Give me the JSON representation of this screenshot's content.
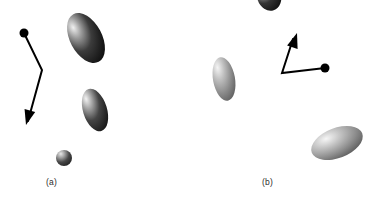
{
  "figure": {
    "width": 383,
    "height": 202,
    "background": "#ffffff",
    "type": "scientific-diagram"
  },
  "panels": [
    {
      "id": "a",
      "label": "(a)",
      "label_x": 46,
      "label_y": 177
    },
    {
      "id": "b",
      "label": "(b)",
      "label_x": 262,
      "label_y": 177
    }
  ],
  "ellipsoids": [
    {
      "name": "ellipsoid-a-large-top",
      "panel": "a",
      "cx": 86,
      "cy": 38,
      "rx": 16,
      "ry": 27,
      "rotation": -28,
      "light": "#e8e8e8",
      "dark": "#1a1a1a"
    },
    {
      "name": "ellipsoid-a-mid",
      "panel": "a",
      "cx": 95,
      "cy": 110,
      "rx": 12,
      "ry": 22,
      "rotation": -17,
      "light": "#ededed",
      "dark": "#222222"
    },
    {
      "name": "ellipsoid-a-small-bottom",
      "panel": "a",
      "cx": 64,
      "cy": 158,
      "rx": 8,
      "ry": 8,
      "rotation": 0,
      "light": "#e0e0e0",
      "dark": "#2a2a2a"
    },
    {
      "name": "ellipsoid-b-top-clipped",
      "panel": "b",
      "cx": 269,
      "cy": -4,
      "rx": 12,
      "ry": 15,
      "rotation": -18,
      "light": "#e6e6e6",
      "dark": "#1c1c1c"
    },
    {
      "name": "ellipsoid-b-left",
      "panel": "b",
      "cx": 224,
      "cy": 79,
      "rx": 11,
      "ry": 22,
      "rotation": -10,
      "light": "#f0f0f0",
      "dark": "#6a6a6a"
    },
    {
      "name": "ellipsoid-b-bottom-right",
      "panel": "b",
      "cx": 337,
      "cy": 143,
      "rx": 27,
      "ry": 15,
      "rotation": -21,
      "light": "#f2f2f2",
      "dark": "#5e5e5e"
    }
  ],
  "arrows": [
    {
      "name": "vector-path-a",
      "panel": "a",
      "color": "#000000",
      "stroke_width": 2,
      "start_dot": {
        "x": 24,
        "y": 33,
        "r": 4.5
      },
      "points": [
        {
          "x": 24,
          "y": 33
        },
        {
          "x": 42,
          "y": 70
        },
        {
          "x": 28,
          "y": 121
        }
      ],
      "arrowhead": {
        "x": 26,
        "y": 125,
        "angle": 105
      }
    },
    {
      "name": "vector-path-b",
      "panel": "b",
      "color": "#000000",
      "stroke_width": 2,
      "start_dot": {
        "x": 325,
        "y": 68,
        "r": 4.5
      },
      "points": [
        {
          "x": 325,
          "y": 68
        },
        {
          "x": 282,
          "y": 73
        },
        {
          "x": 293,
          "y": 39
        }
      ],
      "arrowhead": {
        "x": 297,
        "y": 33,
        "angle": -72
      }
    }
  ]
}
